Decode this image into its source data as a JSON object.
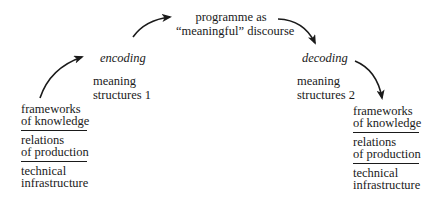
{
  "diagram": {
    "type": "encoding-decoding-model",
    "top": {
      "line1": "programme as",
      "line2": "“meaningful” discourse"
    },
    "encoding": {
      "label": "encoding",
      "meaning_line1": "meaning",
      "meaning_line2": "structures 1"
    },
    "decoding": {
      "label": "decoding",
      "meaning_line1": "meaning",
      "meaning_line2": "structures 2"
    },
    "left_stack": [
      {
        "line1": "frameworks",
        "line2": "of knowledge"
      },
      {
        "line1": "relations",
        "line2": "of production"
      },
      {
        "line1": "technical",
        "line2": "infrastructure"
      }
    ],
    "right_stack": [
      {
        "line1": "frameworks",
        "line2": "of knowledge"
      },
      {
        "line1": "relations",
        "line2": "of production"
      },
      {
        "line1": "technical",
        "line2": "infrastructure"
      }
    ],
    "arrows": [
      {
        "from": "left_stack",
        "to": "encoding"
      },
      {
        "from": "encoding",
        "to": "programme"
      },
      {
        "from": "programme",
        "to": "decoding"
      },
      {
        "from": "decoding",
        "to": "right_stack"
      }
    ],
    "colors": {
      "ink": "#1a1a1a",
      "background": "#ffffff"
    }
  }
}
